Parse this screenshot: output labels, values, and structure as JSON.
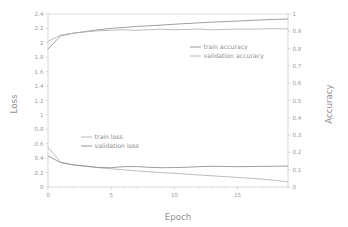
{
  "chart_data": {
    "type": "line",
    "title": "",
    "xlabel": "Epoch",
    "ylabel": "Loss",
    "y2label": "Accuracy",
    "xlim": [
      0,
      19
    ],
    "ylim": [
      0,
      2.4
    ],
    "y2lim": [
      0,
      1
    ],
    "grid": false,
    "legend_position": "inside-two-blocks",
    "x": [
      0,
      1,
      2,
      3,
      4,
      5,
      6,
      7,
      8,
      9,
      10,
      11,
      12,
      13,
      14,
      15,
      16,
      17,
      18,
      19
    ],
    "x_ticks": [
      "0",
      "5",
      "10",
      "15"
    ],
    "x_tick_values": [
      0,
      5,
      10,
      15
    ],
    "x_minor_tick_step": 1,
    "y_ticks": [
      "0",
      "0.2",
      "0.4",
      "0.6",
      "0.8",
      "1",
      "1.2",
      "1.4",
      "1.6",
      "1.8",
      "2",
      "2.2",
      "2.4"
    ],
    "y_tick_values": [
      0,
      0.2,
      0.4,
      0.6,
      0.8,
      1,
      1.2,
      1.4,
      1.6,
      1.8,
      2,
      2.2,
      2.4
    ],
    "y2_ticks": [
      "0",
      "0.1",
      "0.2",
      "0.3",
      "0.4",
      "0.5",
      "0.6",
      "0.7",
      "0.8",
      "0.9",
      "1"
    ],
    "y2_tick_values": [
      0,
      0.1,
      0.2,
      0.3,
      0.4,
      0.5,
      0.6,
      0.7,
      0.8,
      0.9,
      1
    ],
    "series": [
      {
        "name": "train accuracy",
        "axis": "right",
        "color": "#8c8c8c",
        "values": [
          0.797,
          0.874,
          0.889,
          0.899,
          0.909,
          0.917,
          0.922,
          0.928,
          0.932,
          0.936,
          0.941,
          0.945,
          0.949,
          0.953,
          0.956,
          0.959,
          0.963,
          0.966,
          0.969,
          0.971
        ]
      },
      {
        "name": "validation accuracy",
        "axis": "right",
        "color": "#b0b0b0",
        "values": [
          0.842,
          0.878,
          0.889,
          0.897,
          0.903,
          0.906,
          0.909,
          0.906,
          0.909,
          0.912,
          0.909,
          0.911,
          0.913,
          0.908,
          0.911,
          0.913,
          0.912,
          0.914,
          0.915,
          0.913
        ]
      },
      {
        "name": "train loss",
        "axis": "left",
        "color": "#b0b0b0",
        "values": [
          0.55,
          0.345,
          0.305,
          0.285,
          0.268,
          0.252,
          0.238,
          0.224,
          0.212,
          0.2,
          0.19,
          0.178,
          0.166,
          0.155,
          0.144,
          0.133,
          0.121,
          0.108,
          0.092,
          0.072
        ]
      },
      {
        "name": "validation loss",
        "axis": "left",
        "color": "#8c8c8c",
        "values": [
          0.432,
          0.338,
          0.308,
          0.292,
          0.27,
          0.268,
          0.282,
          0.284,
          0.272,
          0.268,
          0.27,
          0.274,
          0.282,
          0.288,
          0.284,
          0.282,
          0.284,
          0.286,
          0.288,
          0.29
        ]
      }
    ]
  },
  "legend_accuracy": {
    "items": [
      {
        "label": "train accuracy",
        "color": "#8c8c8c"
      },
      {
        "label": "validation accuracy",
        "color": "#b0b0b0"
      }
    ]
  },
  "legend_loss": {
    "items": [
      {
        "label": "train loss",
        "color": "#b0b0b0"
      },
      {
        "label": "validation loss",
        "color": "#8c8c8c"
      }
    ]
  },
  "axes": {
    "x_title": "Epoch",
    "y_left_title": "Loss",
    "y_right_title": "Accuracy"
  }
}
